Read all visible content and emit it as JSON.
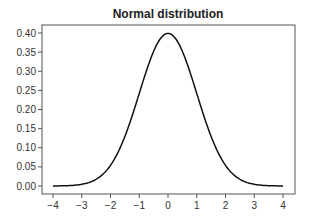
{
  "chart_data": {
    "type": "line",
    "title": "Normal distribution",
    "xlabel": "",
    "ylabel": "",
    "xlim": [
      -4.5,
      4.5
    ],
    "ylim": [
      -0.019,
      0.418
    ],
    "xticks": [
      -4,
      -3,
      -2,
      -1,
      0,
      1,
      2,
      3,
      4
    ],
    "xtick_labels": [
      "−4",
      "−3",
      "−2",
      "−1",
      "0",
      "1",
      "2",
      "3",
      "4"
    ],
    "yticks": [
      0.0,
      0.05,
      0.1,
      0.15,
      0.2,
      0.25,
      0.3,
      0.35,
      0.4
    ],
    "ytick_labels": [
      "0.00",
      "0.05",
      "0.10",
      "0.15",
      "0.20",
      "0.25",
      "0.30",
      "0.35",
      "0.40"
    ],
    "grid": false,
    "legend": null,
    "series": [
      {
        "name": "N(0,1) pdf",
        "color": "#111111",
        "function": "standard_normal_pdf",
        "x_range": [
          -4,
          4
        ],
        "sample_points": {
          "x": [
            -4,
            -3,
            -2,
            -1.5,
            -1,
            -0.5,
            0,
            0.5,
            1,
            1.5,
            2,
            3,
            4
          ],
          "y": [
            0.0001,
            0.0044,
            0.054,
            0.1295,
            0.242,
            0.3521,
            0.3989,
            0.3521,
            0.242,
            0.1295,
            0.054,
            0.0044,
            0.0001
          ]
        }
      }
    ]
  },
  "colors": {
    "background": "#ffffff",
    "axes_frame": "#555555",
    "line": "#111111",
    "text": "#333333"
  }
}
